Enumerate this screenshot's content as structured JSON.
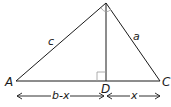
{
  "diagram": {
    "vertices": {
      "A": {
        "label": "A",
        "x": 16,
        "y": 81
      },
      "C": {
        "label": "C",
        "x": 160,
        "y": 81
      },
      "D": {
        "label": "D",
        "x": 106,
        "y": 81
      },
      "apex": {
        "label": "",
        "x": 106,
        "y": 3
      }
    },
    "sides": {
      "c": {
        "label": "c",
        "from": "A",
        "to": "apex"
      },
      "a": {
        "label": "a",
        "from": "apex",
        "to": "C"
      }
    },
    "altitude": {
      "from": "apex",
      "to": "D",
      "right_angle_marker": true
    },
    "measurements": {
      "AD": {
        "label": "b-x"
      },
      "DC": {
        "label": "x"
      }
    },
    "colors": {
      "stroke": "#1a1a1a",
      "background": "#ffffff",
      "marker": "#9a9a9a"
    }
  }
}
